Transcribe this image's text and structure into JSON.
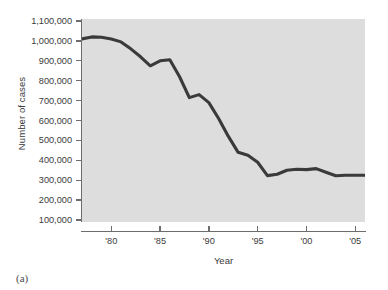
{
  "figure": {
    "caption_label": "(a)",
    "panel_bg": "#dddddd",
    "page_bg": "#ffffff",
    "line_color": "#3a3a3a",
    "axis_color": "#6d6d6d",
    "text_color": "#3b3b3b"
  },
  "chart_data": {
    "type": "line",
    "title": "",
    "xlabel": "Year",
    "ylabel": "Number of cases",
    "xlim": [
      1977,
      2006
    ],
    "ylim": [
      0,
      1100000
    ],
    "grid": false,
    "legend": null,
    "y_ticks": [
      1100000,
      1000000,
      900000,
      800000,
      700000,
      600000,
      500000,
      400000,
      300000,
      200000,
      100000
    ],
    "y_tick_labels": [
      "1,100,000",
      "1,000,000",
      "900,000",
      "800,000",
      "700,000",
      "600,000",
      "500,000",
      "400,000",
      "300,000",
      "200,000",
      "100,000"
    ],
    "x_ticks": [
      1980,
      1985,
      1990,
      1995,
      2000,
      2005
    ],
    "x_tick_labels": [
      "'80",
      "'85",
      "'90",
      "'95",
      "'00",
      "'05"
    ],
    "series": [
      {
        "name": "Number of cases",
        "x": [
          1977,
          1978,
          1979,
          1980,
          1981,
          1982,
          1983,
          1984,
          1985,
          1986,
          1987,
          1988,
          1989,
          1990,
          1991,
          1992,
          1993,
          1994,
          1995,
          1996,
          1997,
          1998,
          1999,
          2000,
          2001,
          2002,
          2003,
          2004,
          2005,
          2006
        ],
        "values": [
          1010000,
          1020000,
          1018000,
          1010000,
          995000,
          960000,
          920000,
          875000,
          900000,
          905000,
          820000,
          715000,
          730000,
          690000,
          610000,
          520000,
          440000,
          425000,
          390000,
          323000,
          330000,
          350000,
          355000,
          353000,
          358000,
          340000,
          322000,
          325000,
          325000,
          325000
        ]
      }
    ]
  }
}
